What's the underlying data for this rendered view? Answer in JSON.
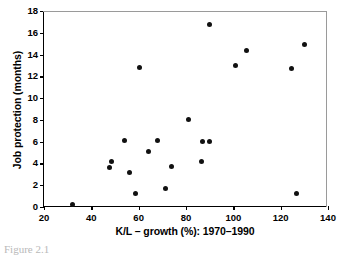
{
  "figure": {
    "caption": "Figure 2.1"
  },
  "chart_data": {
    "type": "scatter",
    "title": "",
    "xlabel": "K/L – growth (%): 1970–1990",
    "ylabel": "Job protection (months)",
    "xlim": [
      20,
      140
    ],
    "ylim": [
      0,
      18
    ],
    "xticks": [
      20,
      40,
      60,
      80,
      100,
      120,
      140
    ],
    "yticks": [
      0,
      2,
      4,
      6,
      8,
      10,
      12,
      14,
      16,
      18
    ],
    "grid": false,
    "legend": null,
    "marker": "filled-circle",
    "marker_color": "#111111",
    "points": [
      {
        "x": 32.0,
        "y": 0.2
      },
      {
        "x": 47.5,
        "y": 3.6
      },
      {
        "x": 48.5,
        "y": 4.2
      },
      {
        "x": 54.0,
        "y": 6.1
      },
      {
        "x": 56.0,
        "y": 3.2
      },
      {
        "x": 58.5,
        "y": 1.2
      },
      {
        "x": 60.5,
        "y": 12.8
      },
      {
        "x": 64.0,
        "y": 5.1
      },
      {
        "x": 68.0,
        "y": 6.1
      },
      {
        "x": 71.5,
        "y": 1.7
      },
      {
        "x": 74.0,
        "y": 3.7
      },
      {
        "x": 81.0,
        "y": 8.0
      },
      {
        "x": 86.5,
        "y": 4.2
      },
      {
        "x": 87.0,
        "y": 6.0
      },
      {
        "x": 90.0,
        "y": 6.0
      },
      {
        "x": 90.0,
        "y": 16.8
      },
      {
        "x": 101.0,
        "y": 13.0
      },
      {
        "x": 105.5,
        "y": 14.4
      },
      {
        "x": 124.5,
        "y": 12.7
      },
      {
        "x": 126.5,
        "y": 1.2
      },
      {
        "x": 130.0,
        "y": 14.9
      }
    ]
  }
}
